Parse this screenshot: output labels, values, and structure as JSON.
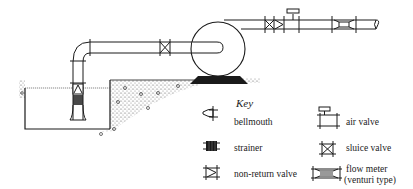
{
  "figure": {
    "type": "pumping station schematic",
    "components": [
      "suction well",
      "bellmouth",
      "strainer",
      "suction pipe",
      "sluice valve",
      "pump",
      "non-return valve",
      "air valve",
      "flow meter (venturi type)",
      "delivery pipe",
      "ground"
    ]
  },
  "key": {
    "title": "Key",
    "items": [
      {
        "symbol": "bellmouth-icon",
        "label": "bellmouth"
      },
      {
        "symbol": "strainer-icon",
        "label": "strainer"
      },
      {
        "symbol": "non-return-valve-icon",
        "label": "non-return valve"
      },
      {
        "symbol": "air-valve-icon",
        "label": "air valve"
      },
      {
        "symbol": "sluice-valve-icon",
        "label": "sluice valve"
      },
      {
        "symbol": "flow-meter-icon",
        "label_line1": "flow meter",
        "label_line2": "(venturi type)"
      }
    ]
  },
  "colors": {
    "line": "#1a1a1a",
    "ground": "#bdbdbd",
    "background": "#ffffff"
  }
}
